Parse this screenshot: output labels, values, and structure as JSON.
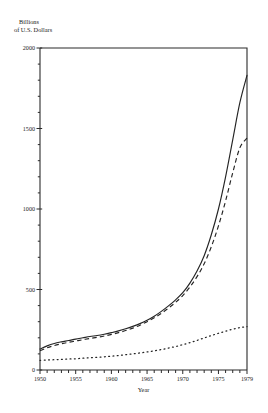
{
  "chart_data": {
    "type": "line",
    "title": "",
    "ylabel": "Billions\nof U.S. Dollars",
    "ylabel_line1": "Billions",
    "ylabel_line2": "of U.S. Dollars",
    "xlabel": "Year",
    "xlim": [
      1950,
      1979
    ],
    "ylim": [
      0,
      2000
    ],
    "ytick_labels": [
      "0",
      "500",
      "1000",
      "1500",
      "2000"
    ],
    "ytick_values": [
      0,
      500,
      1000,
      1500,
      2000
    ],
    "xtick_labels": [
      "1950",
      "1955",
      "1960",
      "1965",
      "1970",
      "1975",
      "1979"
    ],
    "xtick_values": [
      1950,
      1955,
      1960,
      1965,
      1970,
      1975,
      1979
    ],
    "minor_xticks_every": 1,
    "minor_yticks_every": 100,
    "grid": false,
    "legend": "none",
    "x": [
      1950,
      1951,
      1952,
      1953,
      1954,
      1955,
      1956,
      1957,
      1958,
      1959,
      1960,
      1961,
      1962,
      1963,
      1964,
      1965,
      1966,
      1967,
      1968,
      1969,
      1970,
      1971,
      1972,
      1973,
      1974,
      1975,
      1976,
      1977,
      1978,
      1979
    ],
    "series": [
      {
        "name": "series-solid",
        "style": "solid",
        "values": [
          130,
          150,
          165,
          175,
          183,
          192,
          200,
          208,
          214,
          222,
          232,
          243,
          256,
          271,
          288,
          309,
          334,
          364,
          398,
          436,
          480,
          540,
          615,
          710,
          840,
          1000,
          1200,
          1430,
          1660,
          1830
        ]
      },
      {
        "name": "series-dashed",
        "style": "dashed",
        "values": [
          120,
          138,
          152,
          163,
          172,
          180,
          188,
          196,
          203,
          211,
          221,
          232,
          245,
          260,
          278,
          300,
          324,
          352,
          384,
          420,
          462,
          515,
          580,
          660,
          765,
          895,
          1050,
          1225,
          1380,
          1440
        ]
      },
      {
        "name": "series-dotted",
        "style": "dotted",
        "values": [
          60,
          62,
          64,
          66,
          68,
          70,
          73,
          76,
          79,
          82,
          86,
          90,
          95,
          100,
          106,
          112,
          119,
          127,
          136,
          146,
          157,
          170,
          184,
          199,
          214,
          228,
          241,
          253,
          263,
          270
        ]
      }
    ]
  }
}
